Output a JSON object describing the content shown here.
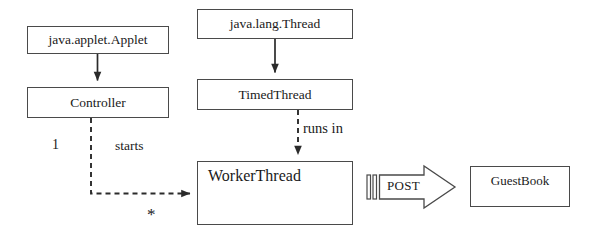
{
  "diagram": {
    "type": "uml-class-diagram",
    "background_color": "#ffffff",
    "stroke_color": "#4a4a4a",
    "text_color": "#1a1a1a",
    "classes": [
      {
        "id": "java-applet-applet",
        "label": "java.applet.Applet",
        "x": 27,
        "y": 26,
        "w": 142,
        "h": 28,
        "font_size": 13.5,
        "text_align": "center",
        "text_valign": "middle"
      },
      {
        "id": "controller",
        "label": "Controller",
        "x": 27,
        "y": 87,
        "w": 142,
        "h": 31,
        "font_size": 13.5,
        "text_align": "center",
        "text_valign": "middle"
      },
      {
        "id": "java-lang-thread",
        "label": "java.lang.Thread",
        "x": 197,
        "y": 9,
        "w": 156,
        "h": 30,
        "font_size": 13.5,
        "text_align": "center",
        "text_valign": "middle"
      },
      {
        "id": "timed-thread",
        "label": "TimedThread",
        "x": 197,
        "y": 79,
        "w": 156,
        "h": 31,
        "font_size": 13.5,
        "text_align": "center",
        "text_valign": "middle"
      },
      {
        "id": "worker-thread",
        "label": "WorkerThread",
        "x": 197,
        "y": 161,
        "w": 156,
        "h": 64,
        "font_size": 16,
        "text_align": "left",
        "text_valign": "top"
      },
      {
        "id": "guest-book",
        "label": "GuestBook",
        "x": 470,
        "y": 166,
        "w": 100,
        "h": 41,
        "font_size": 13,
        "text_align": "center",
        "text_valign": "middle"
      }
    ],
    "connectors": [
      {
        "id": "applet-to-controller",
        "from": "java-applet-applet",
        "to": "controller",
        "style": "solid",
        "arrow": "filled-triangle",
        "label": ""
      },
      {
        "id": "thread-to-timedthread",
        "from": "java-lang-thread",
        "to": "timed-thread",
        "style": "solid",
        "arrow": "filled-triangle",
        "label": ""
      },
      {
        "id": "timedthread-to-workerthread",
        "from": "timed-thread",
        "to": "worker-thread",
        "style": "dashed",
        "arrow": "filled-triangle",
        "label": "runs in"
      },
      {
        "id": "controller-to-workerthread",
        "from": "controller",
        "to": "worker-thread",
        "style": "dashed",
        "arrow": "filled-triangle",
        "label": "starts"
      },
      {
        "id": "workerthread-to-guestbook",
        "from": "worker-thread",
        "to": "guest-book",
        "style": "block-arrow",
        "arrow": "open-block",
        "label": "POST"
      }
    ],
    "labels": {
      "runs_in": "runs in",
      "starts": "starts",
      "multiplicity_one": "1",
      "multiplicity_many": "*",
      "post": "POST"
    }
  }
}
